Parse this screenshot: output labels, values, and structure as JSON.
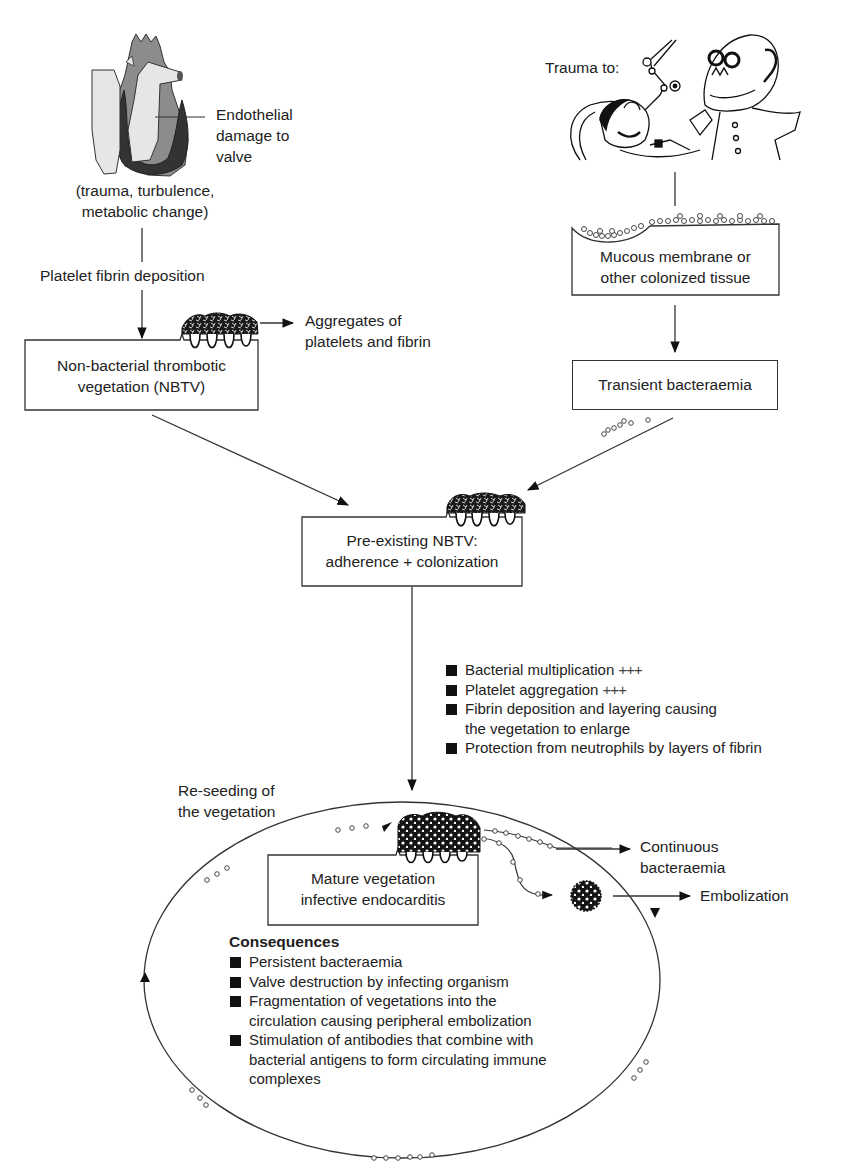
{
  "figure": {
    "caption_partial": "Fig. — Pathogenesis of infective endocarditis (caption cut off)"
  },
  "left_branch": {
    "heart_label": "Endothelial damage to valve",
    "heart_label_lines": [
      "Endothelial",
      "damage to",
      "valve"
    ],
    "causes_lines": [
      "(trauma, turbulence,",
      "metabolic change)"
    ],
    "step_label": "Platelet fibrin deposition",
    "nbtv_box_lines": [
      "Non-bacterial thrombotic",
      "vegetation (NBTV)"
    ],
    "aggregates_lines": [
      "Aggregates of",
      "platelets and fibrin"
    ]
  },
  "right_branch": {
    "trauma_label": "Trauma to:",
    "mucous_box_lines": [
      "Mucous membrane or",
      "other colonized tissue"
    ],
    "bacteraemia_box": "Transient bacteraemia"
  },
  "merge": {
    "preexisting_box_lines": [
      "Pre-existing NBTV:",
      "adherence + colonization"
    ],
    "processes": [
      {
        "text": "Bacterial multiplication",
        "suffix": "+++"
      },
      {
        "text": "Platelet aggregation",
        "suffix": "+++"
      },
      {
        "text": "Fibrin deposition and layering causing",
        "cont": "the vegetation to enlarge"
      },
      {
        "text": "Protection from neutrophils by layers of fibrin"
      }
    ]
  },
  "cycle": {
    "reseeding_lines": [
      "Re-seeding of",
      "the vegetation"
    ],
    "mature_box_lines": [
      "Mature vegetation",
      "infective endocarditis"
    ],
    "continuous_lines": [
      "Continuous",
      "bacteraemia"
    ],
    "embolization": "Embolization",
    "consequences_title": "Consequences",
    "consequences": [
      {
        "lines": [
          "Persistent bacteraemia"
        ]
      },
      {
        "lines": [
          "Valve destruction by infecting organism"
        ]
      },
      {
        "lines": [
          "Fragmentation of vegetations into the",
          "circulation causing peripheral embolization"
        ]
      },
      {
        "lines": [
          "Stimulation of antibodies that combine with",
          "bacterial antigens to form circulating immune",
          "complexes"
        ]
      }
    ]
  },
  "icons": {
    "heart": "heart-illustration",
    "dentist": "dentist-cartoon",
    "vegetation": "vegetation-cluster",
    "embolus": "embolus-cluster",
    "bacteria": "bacteria-chain"
  },
  "colors": {
    "line": "#333333",
    "text": "#222222",
    "heart_dark": "#3a3a3a",
    "heart_mid": "#8a8a8a",
    "heart_light": "#e4e4e4"
  }
}
